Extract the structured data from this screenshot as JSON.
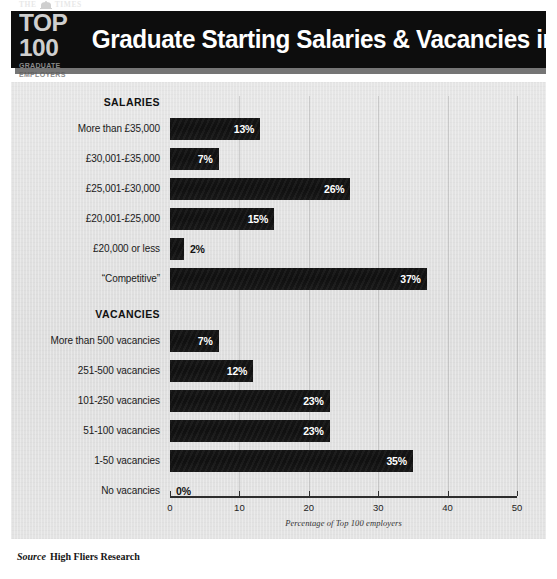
{
  "header": {
    "logo": {
      "masthead": "THE TIMES",
      "crest_icon": "times-crest-icon",
      "top_line": "TOP 100",
      "sub_line": "GRADUATE EMPLOYERS"
    },
    "title": "Graduate Starting Salaries & Vacancies in 2014"
  },
  "source": {
    "label": "Source",
    "text": "High Fliers Research"
  },
  "colors": {
    "banner": "#0d0d0d",
    "panel": "#e2e2e2",
    "bar": "#141414",
    "value_on_bar": "#ffffff",
    "value_off_bar": "#121212"
  },
  "chart_data": {
    "type": "bar",
    "orientation": "horizontal",
    "title": "Graduate Starting Salaries & Vacancies in 2014",
    "xlabel": "Percentage of Top 100 employers",
    "ylabel": "",
    "xlim": [
      0,
      50
    ],
    "xticks": [
      0,
      10,
      20,
      30,
      40,
      50
    ],
    "xtick_labels": [
      "0",
      "10",
      "20",
      "30",
      "40",
      "50"
    ],
    "grid": true,
    "legend": "none",
    "value_suffix": "%",
    "groups": [
      {
        "name": "SALARIES",
        "categories": [
          "More than £35,000",
          "£30,001-£35,000",
          "£25,001-£30,000",
          "£20,001-£25,000",
          "£20,000 or less",
          "“Competitive”"
        ],
        "values": [
          13,
          7,
          26,
          15,
          2,
          37
        ],
        "value_labels": [
          "13%",
          "7%",
          "26%",
          "15%",
          "2%",
          "37%"
        ]
      },
      {
        "name": "VACANCIES",
        "categories": [
          "More than 500 vacancies",
          "251-500 vacancies",
          "101-250 vacancies",
          "51-100 vacancies",
          "1-50 vacancies",
          "No vacancies"
        ],
        "values": [
          7,
          12,
          23,
          23,
          35,
          0
        ],
        "value_labels": [
          "7%",
          "12%",
          "23%",
          "23%",
          "35%",
          "0%"
        ]
      }
    ]
  }
}
